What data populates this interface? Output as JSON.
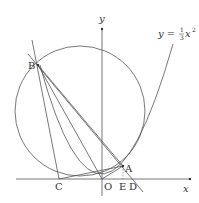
{
  "diagram": {
    "axes": {
      "x_label": "x",
      "y_label": "y"
    },
    "curve_label": {
      "prefix": "y = ",
      "num": "1",
      "den": "3",
      "suffix": "x",
      "exp": "2"
    },
    "points": {
      "A": "A",
      "B": "B",
      "C": "C",
      "D": "D",
      "E": "E",
      "O": "O"
    },
    "colors": {
      "stroke": "#555555",
      "text": "#333333"
    }
  }
}
